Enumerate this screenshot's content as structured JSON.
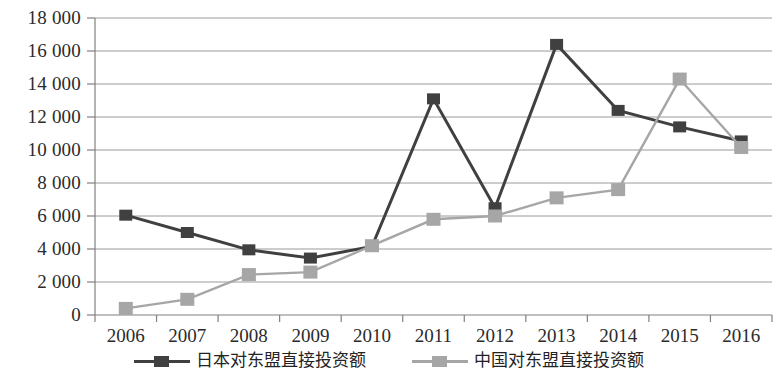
{
  "chart_data": {
    "type": "line",
    "title": "",
    "xlabel": "",
    "ylabel": "",
    "categories": [
      "2006",
      "2007",
      "2008",
      "2009",
      "2010",
      "2011",
      "2012",
      "2013",
      "2014",
      "2015",
      "2016"
    ],
    "ylim": [
      0,
      18000
    ],
    "ytick_step": 2000,
    "ytick_labels": [
      "18 000",
      "16 000",
      "14 000",
      "12 000",
      "10 000",
      "8 000",
      "6 000",
      "4 000",
      "2 000",
      "0"
    ],
    "ytick_values": [
      18000,
      16000,
      14000,
      12000,
      10000,
      8000,
      6000,
      4000,
      2000,
      0
    ],
    "grid": true,
    "grid_axis": "y",
    "legend_position": "bottom",
    "series": [
      {
        "name": "日本对东盟直接投资额",
        "color": "#404040",
        "marker": "square",
        "values": [
          6050,
          5000,
          3950,
          3450,
          4150,
          13100,
          6500,
          16400,
          12400,
          11400,
          10550
        ]
      },
      {
        "name": "中国对东盟直接投资额",
        "color": "#a6a6a6",
        "marker": "square",
        "values": [
          400,
          950,
          2450,
          2600,
          4200,
          5800,
          6000,
          7100,
          7600,
          14300,
          10150
        ]
      }
    ]
  },
  "axis": {
    "line_color": "#808080",
    "grid_color": "#9a9a9a"
  }
}
